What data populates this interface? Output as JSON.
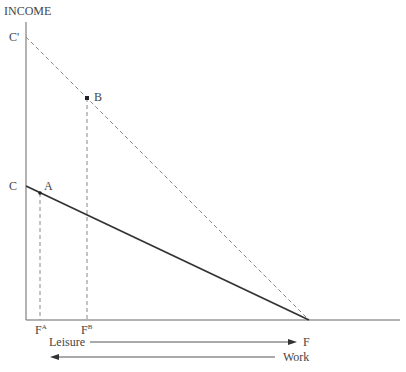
{
  "diagram": {
    "y_axis_label": "INCOME",
    "points": {
      "C_prime": {
        "label": "C'"
      },
      "C": {
        "label": "C"
      },
      "A": {
        "label": "A"
      },
      "B": {
        "label": "B"
      },
      "F": {
        "label": "F"
      }
    },
    "x_ticks": {
      "FA": {
        "base": "F",
        "sup": "A"
      },
      "FB": {
        "base": "F",
        "sup": "B"
      }
    },
    "arrows": {
      "leisure": {
        "label": "Leisure",
        "direction": "right"
      },
      "work": {
        "label": "Work",
        "direction": "left"
      }
    },
    "lines": {
      "budget_low": {
        "from": "C",
        "to": "F",
        "style": "solid"
      },
      "budget_high": {
        "from": "C'",
        "to": "F",
        "style": "dashed"
      }
    },
    "colors": {
      "solid_line": "#333333",
      "dashed_line": "#888888",
      "axis": "#666666"
    }
  }
}
